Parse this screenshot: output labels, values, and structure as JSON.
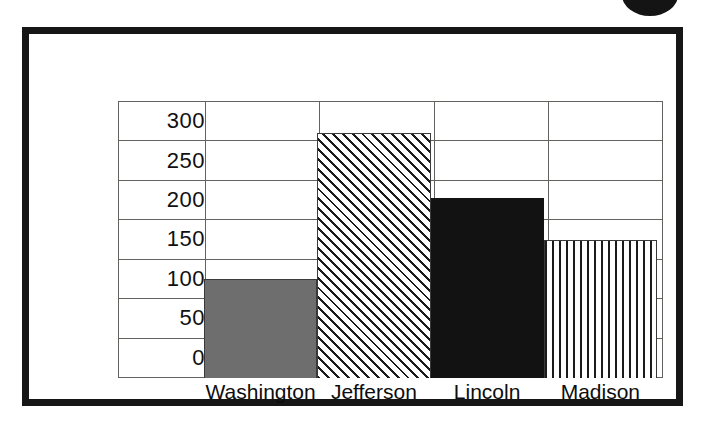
{
  "figure": {
    "frame_color": "#161616",
    "background": "#ffffff",
    "corner_dot_color": "#141414"
  },
  "chart_data": {
    "type": "bar",
    "title": "",
    "subtitle": "",
    "xlabel": "",
    "ylabel": "",
    "categories": [
      "Washington",
      "Jefferson",
      "Lincoln",
      "Madison"
    ],
    "values": [
      125,
      310,
      228,
      175
    ],
    "series": [
      {
        "name": "",
        "values": [
          125,
          310,
          228,
          175
        ]
      }
    ],
    "ytick_labels": [
      "300",
      "250",
      "200",
      "150",
      "100",
      "50",
      "0"
    ],
    "yticks": [
      300,
      250,
      200,
      150,
      100,
      50,
      0
    ],
    "ylim": [
      0,
      350
    ],
    "grid": true,
    "grid_style": "table-cells",
    "legend": false,
    "legend_position": "none",
    "bar_fills": [
      "solid-gray",
      "diagonal-hatch",
      "solid-black",
      "vertical-stripes"
    ],
    "bar_colors": [
      "#6e6e6e",
      "#ffffff",
      "#121212",
      "#ffffff"
    ]
  },
  "axis": {
    "tick_300": "300",
    "tick_250": "250",
    "tick_200": "200",
    "tick_150": "150",
    "tick_100": "100",
    "tick_50": "50",
    "tick_0": "0"
  },
  "categories": {
    "c0": "Washington",
    "c1": "Jefferson",
    "c2": "Lincoln",
    "c3": "Madison"
  }
}
